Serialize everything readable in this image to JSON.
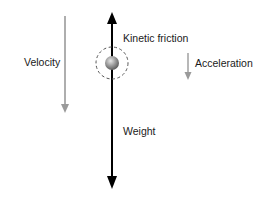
{
  "diagram": {
    "labels": {
      "kinetic_friction": "Kinetic friction",
      "velocity": "Velocity",
      "acceleration": "Acceleration",
      "weight": "Weight"
    },
    "colors": {
      "force_arrow": "#000000",
      "motion_arrow": "#9a9a9a",
      "ball": "#8a8a8a",
      "dashed_circle": "#555555",
      "text": "#1a1a1a"
    }
  }
}
